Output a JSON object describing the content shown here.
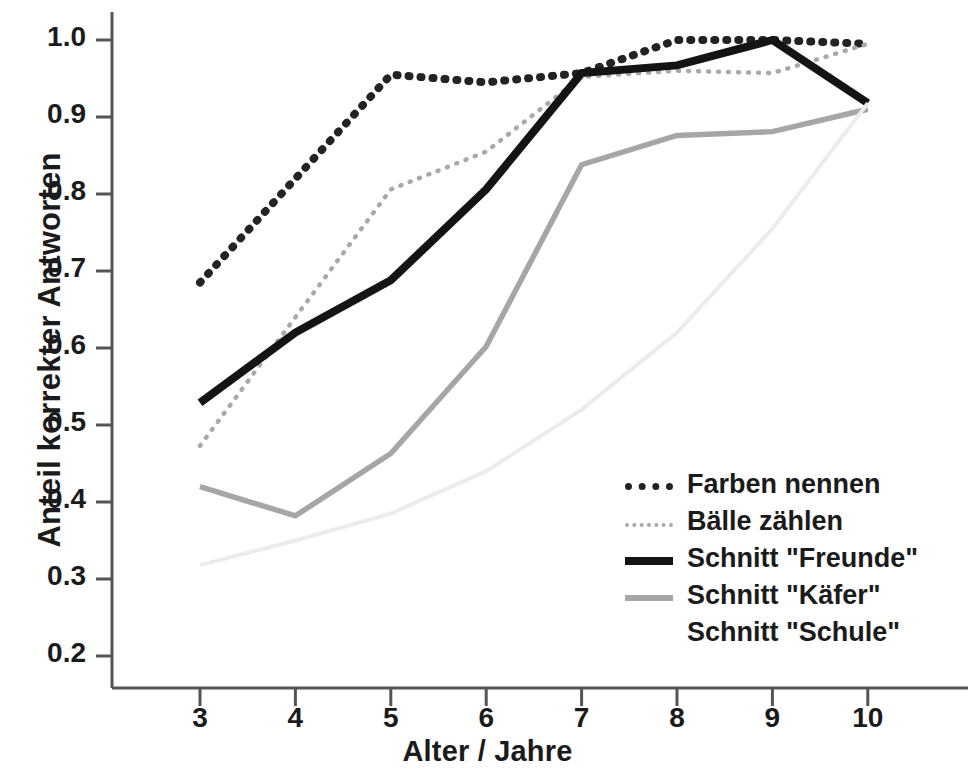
{
  "chart_data": {
    "type": "line",
    "title": "",
    "xlabel": "Alter / Jahre",
    "ylabel": "Anteil korrekter Antworten",
    "x": [
      3,
      4,
      5,
      6,
      7,
      8,
      9,
      10
    ],
    "xticklabels": [
      "3",
      "4",
      "5",
      "6",
      "7",
      "8",
      "9",
      "10"
    ],
    "yticklabels": [
      "1.0",
      "0.9",
      "0.8",
      "0.7",
      "0.6",
      "0.5",
      "0.4",
      "0.3",
      "0.2"
    ],
    "ytickvalues": [
      1.0,
      0.9,
      0.8,
      0.7,
      0.6,
      0.5,
      0.4,
      0.3,
      0.2
    ],
    "xlim": [
      2.6,
      10.5
    ],
    "ylim": [
      0.155,
      1.04
    ],
    "grid": false,
    "legend_position": "inside lower right",
    "series": [
      {
        "name": "Farben nennen",
        "style": "thick-dotted",
        "color": "#232323",
        "values": [
          0.685,
          0.82,
          0.955,
          0.945,
          0.957,
          1.0,
          1.0,
          0.995
        ]
      },
      {
        "name": "Bälle zählen",
        "style": "thin-dotted",
        "color": "#a9a9a9",
        "values": [
          0.473,
          0.64,
          0.806,
          0.855,
          0.952,
          0.96,
          0.957,
          0.995
        ]
      },
      {
        "name": "Schnitt \"Freunde\"",
        "style": "thick-solid",
        "color": "#141414",
        "values": [
          0.529,
          0.62,
          0.688,
          0.806,
          0.957,
          0.967,
          1.0,
          0.918
        ]
      },
      {
        "name": "Schnitt \"Käfer\"",
        "style": "solid",
        "color": "#a6a6a6",
        "values": [
          0.42,
          0.382,
          0.463,
          0.602,
          0.838,
          0.876,
          0.881,
          0.91
        ]
      },
      {
        "name": "Schnitt \"Schule\"",
        "style": "faint-solid",
        "color": "#ececec",
        "values": [
          0.318,
          0.35,
          0.385,
          0.44,
          0.52,
          0.62,
          0.755,
          0.918
        ]
      }
    ]
  },
  "legend": {
    "items": [
      {
        "label": "Farben nennen",
        "swatch": "sw-thickdot"
      },
      {
        "label": "Bälle zählen",
        "swatch": "sw-thindot"
      },
      {
        "label": "Schnitt \"Freunde\"",
        "swatch": "sw-solid-black"
      },
      {
        "label": "Schnitt \"Käfer\"",
        "swatch": "sw-solid-gray"
      },
      {
        "label": "Schnitt \"Schule\"",
        "swatch": "sw-blank"
      }
    ]
  },
  "axes": {
    "x_title": "Alter / Jahre",
    "y_title": "Anteil korrekter Antworten"
  },
  "colors": {
    "axis": "#555555",
    "text": "#1b1b1b",
    "background": "#ffffff"
  }
}
